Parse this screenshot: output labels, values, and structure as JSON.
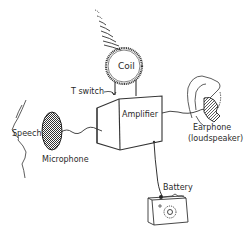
{
  "diagram": {
    "labels": {
      "coil": "Coil",
      "t_switch": "T switch",
      "amplifier": "Amplifier",
      "speech": "Speech",
      "microphone": "Microphone",
      "earphone": "Earphone",
      "earphone_sub": "(loudspeaker)",
      "battery": "Battery"
    },
    "colors": {
      "line": "#2a2a2a",
      "background": "#ffffff"
    }
  }
}
